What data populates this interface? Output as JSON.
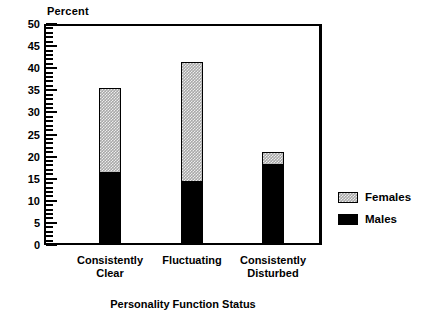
{
  "chart_data": {
    "type": "bar",
    "subtype": "stacked-vertical",
    "title": "",
    "ylabel": "Percent",
    "xlabel": "Personality Function Status",
    "categories": [
      "Consistently\nClear",
      "Fluctuating",
      "Consistently\nDisturbed"
    ],
    "series": [
      {
        "name": "Males",
        "values": [
          16.5,
          14.5,
          18.5
        ],
        "color": "#000000"
      },
      {
        "name": "Females",
        "values": [
          19.0,
          27.0,
          2.5
        ],
        "color": "#a8a8a8"
      }
    ],
    "totals": [
      35.5,
      41.5,
      21.0
    ],
    "ylim": [
      0,
      50
    ],
    "ytick_labels": [
      "0",
      "5",
      "10",
      "15",
      "20",
      "25",
      "30",
      "35",
      "40",
      "45",
      "50"
    ],
    "ytick_values": [
      0,
      5,
      10,
      15,
      20,
      25,
      30,
      35,
      40,
      45,
      50
    ],
    "ytick_minor_step": 1,
    "grid": false,
    "legend_position": "right",
    "legend": [
      {
        "label": "Females",
        "swatch": "grey-stipple"
      },
      {
        "label": "Males",
        "swatch": "black-solid"
      }
    ]
  },
  "axis": {
    "y_title": "Percent",
    "x_title": "Personality Function Status"
  },
  "colors": {
    "frame": "#000000",
    "males": "#000000",
    "females": "#a8a8a8",
    "background": "#ffffff"
  }
}
